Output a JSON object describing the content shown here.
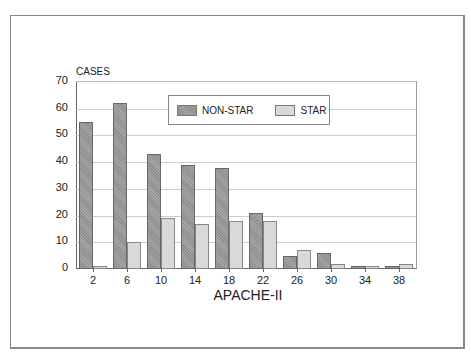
{
  "chart_data": {
    "type": "bar",
    "title": "",
    "xlabel": "APACHE-II",
    "ylabel": "CASES",
    "categories": [
      "2",
      "6",
      "10",
      "14",
      "18",
      "22",
      "26",
      "30",
      "34",
      "38"
    ],
    "series": [
      {
        "name": "NON-STAR",
        "values": [
          55,
          62,
          43,
          39,
          38,
          21,
          5,
          6,
          1,
          1
        ],
        "color": "#999999"
      },
      {
        "name": "STAR",
        "values": [
          1,
          10,
          19,
          17,
          18,
          18,
          7,
          2,
          1,
          2
        ],
        "color": "#d9d9d9"
      }
    ],
    "ylim": [
      0,
      70
    ],
    "yticks": [
      "0",
      "10",
      "20",
      "30",
      "40",
      "50",
      "60",
      "70"
    ],
    "grid": true,
    "legend_position": "top-center-inside"
  }
}
